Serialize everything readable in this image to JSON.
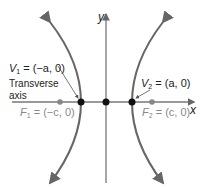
{
  "diagram": {
    "type": "hyperbola_horizontal_transverse_axis",
    "axes": {
      "x_label": "x",
      "y_label": "y"
    },
    "colors": {
      "curve": "#666666",
      "axis": "#777777",
      "point": "#111111",
      "focus": "#888888",
      "focus_text": "#888888",
      "text": "#222222"
    },
    "labels": {
      "v1": {
        "name": "V",
        "sub": "1",
        "rest": " = (−a, 0)"
      },
      "v2": {
        "name": "V",
        "sub": "2",
        "rest": " = (a, 0)"
      },
      "f1": {
        "name": "F",
        "sub": "1",
        "rest": " = (−c, 0)"
      },
      "f2": {
        "name": "F",
        "sub": "2",
        "rest": " = (c, 0)"
      },
      "transverse_line1": "Transverse",
      "transverse_line2": "axis"
    }
  }
}
